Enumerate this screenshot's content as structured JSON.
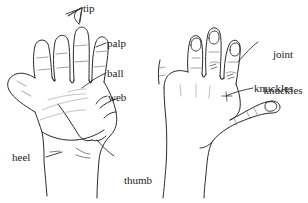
{
  "figure": {
    "background_color": "#ffffff",
    "ink_color": "#2b2b2b",
    "faint_ink_color": "#a9a9a9"
  },
  "left_hand": {
    "name": "palm-view-hand",
    "view": "palm",
    "labels": {
      "tip": "tip",
      "palp": "palp",
      "ball": "ball",
      "web": "web",
      "heel": "heel",
      "thumb_pad_line1": "thumb",
      "thumb_pad_line2": "pad"
    }
  },
  "right_hand": {
    "name": "back-view-hand",
    "view": "back",
    "labels": {
      "joint_line1": "joint",
      "joint_line2": "knuckles",
      "knuckles": "knuckles"
    }
  }
}
